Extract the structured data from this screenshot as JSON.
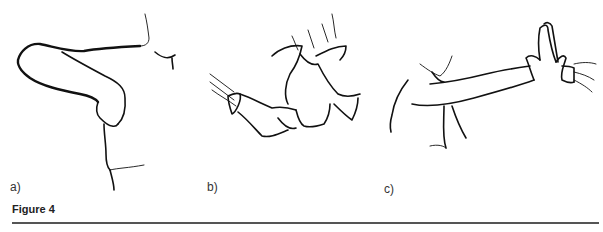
{
  "figure": {
    "caption": "Figure 4",
    "panels": [
      {
        "label": "a)",
        "description": "Arm flexed across body with hand resting at side of torso"
      },
      {
        "label": "b)",
        "description": "Gloved hands of examiner gripping patient's fist"
      },
      {
        "label": "c)",
        "description": "Outstretched arm pressing palm against examiner's gloved hand"
      }
    ]
  }
}
